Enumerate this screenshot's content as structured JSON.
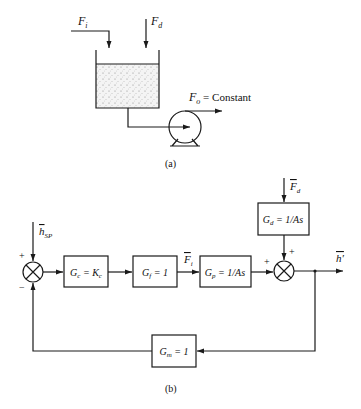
{
  "figure": {
    "part_a": {
      "caption": "(a)",
      "inlet_flow_label": "F",
      "inlet_flow_sub": "i",
      "disturbance_flow_label": "F",
      "disturbance_flow_sub": "d",
      "outlet_flow_label": "F",
      "outlet_flow_sub": "o",
      "outlet_flow_text": " = Constant",
      "components": [
        "tank",
        "liquid",
        "pump"
      ]
    },
    "part_b": {
      "caption": "(b)",
      "setpoint_label": "h",
      "setpoint_sub": "SP",
      "junction1_plus": "+",
      "junction1_minus": "−",
      "junction2_plus_left": "+",
      "junction2_plus_top": "+",
      "blocks": {
        "controller": {
          "lhs": "G",
          "sub": "c",
          "rhs": " = K",
          "rhs_sub": "c"
        },
        "final_element": {
          "lhs": "G",
          "sub": "f",
          "rhs": " = 1"
        },
        "process": {
          "lhs": "G",
          "sub": "p",
          "rhs": " = 1/As"
        },
        "disturbance": {
          "lhs": "G",
          "sub": "d",
          "rhs": " = 1/As"
        },
        "measurement": {
          "lhs": "G",
          "sub": "m",
          "rhs": " = 1"
        }
      },
      "signal_fi_label": "F",
      "signal_fi_sub": "i",
      "signal_fd_label": "F",
      "signal_fd_sub": "d",
      "output_label": "h′"
    },
    "colors": {
      "ink": "#1a1a1a",
      "background": "#ffffff"
    }
  }
}
